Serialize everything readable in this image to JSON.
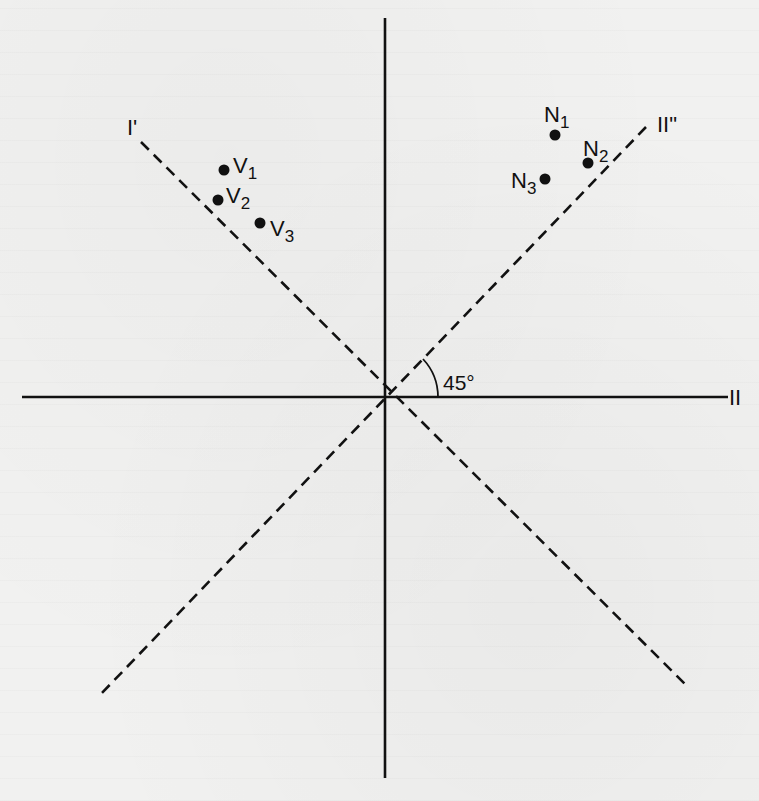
{
  "diagram": {
    "type": "factor-plot",
    "axes": {
      "horizontal_label": "II",
      "rotated_axis_1_label": "I'",
      "rotated_axis_2_label": "II\"",
      "angle_label": "45°"
    },
    "points": [
      {
        "id": "V1",
        "base": "V",
        "sub": "1",
        "group": "V"
      },
      {
        "id": "V2",
        "base": "V",
        "sub": "2",
        "group": "V"
      },
      {
        "id": "V3",
        "base": "V",
        "sub": "3",
        "group": "V"
      },
      {
        "id": "N1",
        "base": "N",
        "sub": "1",
        "group": "N"
      },
      {
        "id": "N2",
        "base": "N",
        "sub": "2",
        "group": "N"
      },
      {
        "id": "N3",
        "base": "N",
        "sub": "3",
        "group": "N"
      }
    ],
    "colors": {
      "ink": "#111111",
      "paper": "#f1f1f0"
    }
  }
}
